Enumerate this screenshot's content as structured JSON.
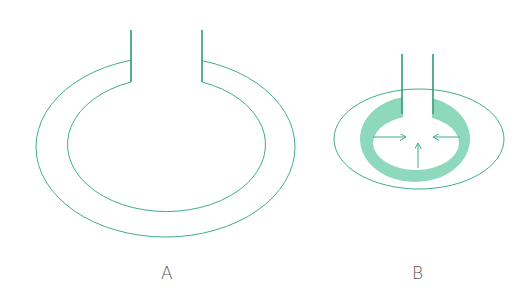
{
  "colors": {
    "line": "#3fae8a",
    "tube": "#2e9b74",
    "ring_fill": "#8ed8bd",
    "label": "#555555"
  },
  "figures": [
    {
      "label": "A",
      "description": "Hollow ring (torus) with open vertical tube; no internal pressure arrows"
    },
    {
      "label": "B",
      "description": "Contracted ring with shaded wall and inward-pointing arrows"
    }
  ]
}
